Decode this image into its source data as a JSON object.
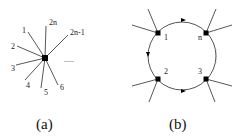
{
  "figure": {
    "panels": [
      {
        "id": "a",
        "caption": "(a)",
        "description": "Single vertex with 2n legs",
        "vertex": {
          "x": 45,
          "y": 58
        },
        "legs": [
          {
            "label": "1",
            "end": [
              28,
              32
            ],
            "label_pos": [
              22,
              33
            ]
          },
          {
            "label": "2",
            "end": [
              17,
              46
            ],
            "label_pos": [
              11,
              49
            ]
          },
          {
            "label": "3",
            "end": [
              16,
              65
            ],
            "label_pos": [
              11,
              71
            ]
          },
          {
            "label": "4",
            "end": [
              25,
              80
            ],
            "label_pos": [
              26,
              88
            ]
          },
          {
            "label": "5",
            "end": [
              41,
              88
            ],
            "label_pos": [
              44,
              95
            ]
          },
          {
            "label": "6",
            "end": [
              58,
              85
            ],
            "label_pos": [
              60,
              90
            ]
          },
          {
            "label": "2n",
            "end": [
              46,
              26
            ],
            "label_pos": [
              49,
              25
            ]
          },
          {
            "label": "2n-1",
            "end": [
              68,
              35
            ],
            "label_pos": [
              70,
              35
            ]
          }
        ],
        "ellipsis": "....."
      },
      {
        "id": "b",
        "caption": "(b)",
        "description": "Loop with n vertices, oriented propagators",
        "circle": {
          "cx": 182,
          "cy": 56,
          "r": 34
        },
        "vertices": [
          {
            "label": "1",
            "x": 158,
            "y": 33
          },
          {
            "label": "n",
            "x": 206,
            "y": 33
          },
          {
            "label": "2",
            "x": 158,
            "y": 79
          },
          {
            "label": "3",
            "x": 206,
            "y": 79
          }
        ],
        "vertical_ellipsis": "....."
      }
    ]
  },
  "colors": {
    "line": "#444444",
    "vertex": "#000000",
    "background": "#ffffff"
  }
}
